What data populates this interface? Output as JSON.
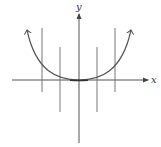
{
  "diagram": {
    "type": "vertical-line-test",
    "axes": {
      "x_label": "x",
      "y_label": "y"
    },
    "curve": {
      "shape": "parabola-opening-upward",
      "vertex": "origin",
      "arrows_on_ends": true
    },
    "vertical_lines": [
      {
        "position": "far-left",
        "intersections_with_curve": 1
      },
      {
        "position": "near-left",
        "intersections_with_curve": 1
      },
      {
        "position": "near-right",
        "intersections_with_curve": 1
      },
      {
        "position": "far-right",
        "intersections_with_curve": 1
      }
    ],
    "colors": {
      "axes": "#555555",
      "curve": "#555555",
      "lines": "#777777",
      "background": "#ffffff"
    }
  }
}
